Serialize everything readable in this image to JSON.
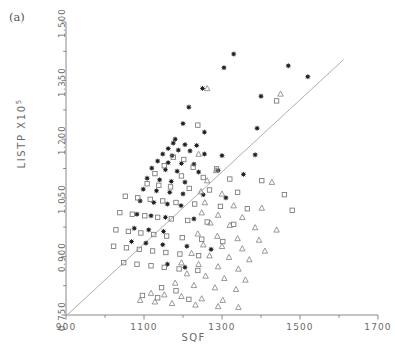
{
  "panel": {
    "label": "(a)"
  },
  "chart_data": {
    "type": "scatter",
    "title": "",
    "panel_label": "(a)",
    "xlabel": "SQF",
    "ylabel": "LISTP X10⁵",
    "ylabel_text": "LISTP X105",
    "xlim": [
      900,
      1700
    ],
    "ylim": [
      0.75,
      1.5
    ],
    "xticks": [
      900,
      1100,
      1300,
      1500,
      1700
    ],
    "xtick_labels": [
      "900",
      "1100",
      "1300",
      "1500",
      "1700"
    ],
    "x_minor_ticks": [
      1000,
      1200,
      1400,
      1600
    ],
    "yticks": [
      0.75,
      0.9,
      1.05,
      1.2,
      1.35,
      1.5
    ],
    "ytick_labels": [
      "0.750",
      "0.900",
      "1.050",
      "1.200",
      "1.350",
      "1.500"
    ],
    "y_minor_ticks": [
      0.825,
      0.975,
      1.125,
      1.275,
      1.425
    ],
    "grid": false,
    "legend_position": "none",
    "axis_style": "left-and-bottom-spines-only",
    "regression_line": {
      "label": "fitted regression line",
      "x_start": 905,
      "y_start": 0.752,
      "x_end": 1612,
      "y_end": 1.404
    },
    "series": [
      {
        "name": "asterisk-markers",
        "marker": "asterisk",
        "marker_label": "filled star/asterisk",
        "color": "#222222",
        "points": [
          [
            1330,
            1.418
          ],
          [
            1470,
            1.388
          ],
          [
            1305,
            1.383
          ],
          [
            1520,
            1.36
          ],
          [
            1250,
            1.33
          ],
          [
            1400,
            1.31
          ],
          [
            1215,
            1.282
          ],
          [
            1200,
            1.24
          ],
          [
            1390,
            1.228
          ],
          [
            1255,
            1.218
          ],
          [
            1180,
            1.2
          ],
          [
            1175,
            1.19
          ],
          [
            1205,
            1.186
          ],
          [
            1235,
            1.184
          ],
          [
            1162,
            1.176
          ],
          [
            1188,
            1.172
          ],
          [
            1218,
            1.17
          ],
          [
            1148,
            1.162
          ],
          [
            1172,
            1.158
          ],
          [
            1255,
            1.162
          ],
          [
            1300,
            1.158
          ],
          [
            1385,
            1.16
          ],
          [
            1135,
            1.144
          ],
          [
            1162,
            1.14
          ],
          [
            1196,
            1.138
          ],
          [
            1228,
            1.136
          ],
          [
            1120,
            1.126
          ],
          [
            1155,
            1.122
          ],
          [
            1185,
            1.118
          ],
          [
            1240,
            1.116
          ],
          [
            1290,
            1.12
          ],
          [
            1355,
            1.11
          ],
          [
            1108,
            1.1
          ],
          [
            1140,
            1.096
          ],
          [
            1170,
            1.092
          ],
          [
            1205,
            1.09
          ],
          [
            1098,
            1.072
          ],
          [
            1132,
            1.068
          ],
          [
            1166,
            1.064
          ],
          [
            1200,
            1.06
          ],
          [
            1252,
            1.058
          ],
          [
            1310,
            1.05
          ],
          [
            1090,
            1.042
          ],
          [
            1125,
            1.038
          ],
          [
            1160,
            1.034
          ],
          [
            1195,
            1.03
          ],
          [
            1082,
            1.008
          ],
          [
            1118,
            1.004
          ],
          [
            1155,
            1.0
          ],
          [
            1228,
            0.996
          ],
          [
            1075,
            0.972
          ],
          [
            1112,
            0.968
          ],
          [
            1150,
            0.964
          ],
          [
            1068,
            0.938
          ],
          [
            1105,
            0.934
          ],
          [
            1148,
            0.93
          ],
          [
            1210,
            0.926
          ],
          [
            1272,
            0.918
          ],
          [
            1160,
            0.88
          ],
          [
            1205,
            0.872
          ]
        ]
      },
      {
        "name": "open-square-markers",
        "marker": "open-square",
        "marker_label": "open square",
        "color": "#777777",
        "points": [
          [
            1238,
            1.236
          ],
          [
            1440,
            1.298
          ],
          [
            1175,
            1.154
          ],
          [
            1202,
            1.148
          ],
          [
            1152,
            1.132
          ],
          [
            1226,
            1.128
          ],
          [
            1286,
            1.124
          ],
          [
            1128,
            1.112
          ],
          [
            1196,
            1.106
          ],
          [
            1252,
            1.102
          ],
          [
            1320,
            1.098
          ],
          [
            1402,
            1.094
          ],
          [
            1108,
            1.086
          ],
          [
            1138,
            1.082
          ],
          [
            1168,
            1.078
          ],
          [
            1216,
            1.074
          ],
          [
            1268,
            1.07
          ],
          [
            1340,
            1.064
          ],
          [
            1460,
            1.058
          ],
          [
            1052,
            1.054
          ],
          [
            1084,
            1.05
          ],
          [
            1116,
            1.046
          ],
          [
            1148,
            1.042
          ],
          [
            1182,
            1.038
          ],
          [
            1230,
            1.034
          ],
          [
            1296,
            1.028
          ],
          [
            1365,
            1.022
          ],
          [
            1480,
            1.018
          ],
          [
            1038,
            1.012
          ],
          [
            1070,
            1.008
          ],
          [
            1102,
            1.004
          ],
          [
            1135,
            1.0
          ],
          [
            1170,
            0.996
          ],
          [
            1212,
            0.992
          ],
          [
            1262,
            0.988
          ],
          [
            1330,
            0.982
          ],
          [
            1028,
            0.968
          ],
          [
            1060,
            0.964
          ],
          [
            1092,
            0.96
          ],
          [
            1125,
            0.956
          ],
          [
            1158,
            0.952
          ],
          [
            1198,
            0.948
          ],
          [
            1248,
            0.944
          ],
          [
            1302,
            0.938
          ],
          [
            1022,
            0.926
          ],
          [
            1055,
            0.922
          ],
          [
            1088,
            0.918
          ],
          [
            1122,
            0.914
          ],
          [
            1156,
            0.91
          ],
          [
            1192,
            0.906
          ],
          [
            1240,
            0.902
          ],
          [
            1048,
            0.884
          ],
          [
            1082,
            0.88
          ],
          [
            1118,
            0.876
          ],
          [
            1152,
            0.872
          ],
          [
            1190,
            0.868
          ],
          [
            1238,
            0.864
          ],
          [
            1145,
            0.82
          ],
          [
            1182,
            0.812
          ],
          [
            1096,
            0.8
          ],
          [
            1135,
            0.794
          ],
          [
            1215,
            0.79
          ]
        ]
      },
      {
        "name": "open-triangle-markers",
        "marker": "open-triangle",
        "marker_label": "open triangle",
        "color": "#888888",
        "points": [
          [
            1262,
            1.33
          ],
          [
            1450,
            1.316
          ],
          [
            1240,
            1.162
          ],
          [
            1285,
            1.12
          ],
          [
            1262,
            1.094
          ],
          [
            1428,
            1.09
          ],
          [
            1246,
            1.066
          ],
          [
            1300,
            1.06
          ],
          [
            1256,
            1.038
          ],
          [
            1330,
            1.03
          ],
          [
            1402,
            1.024
          ],
          [
            1248,
            1.012
          ],
          [
            1290,
            1.006
          ],
          [
            1352,
            1.0
          ],
          [
            1270,
            0.986
          ],
          [
            1320,
            0.98
          ],
          [
            1385,
            0.974
          ],
          [
            1440,
            0.968
          ],
          [
            1238,
            0.958
          ],
          [
            1288,
            0.952
          ],
          [
            1340,
            0.946
          ],
          [
            1395,
            0.942
          ],
          [
            1252,
            0.93
          ],
          [
            1300,
            0.926
          ],
          [
            1352,
            0.92
          ],
          [
            1410,
            0.914
          ],
          [
            1222,
            0.908
          ],
          [
            1268,
            0.902
          ],
          [
            1318,
            0.898
          ],
          [
            1370,
            0.892
          ],
          [
            1196,
            0.884
          ],
          [
            1240,
            0.88
          ],
          [
            1290,
            0.874
          ],
          [
            1342,
            0.868
          ],
          [
            1210,
            0.856
          ],
          [
            1258,
            0.85
          ],
          [
            1306,
            0.844
          ],
          [
            1360,
            0.84
          ],
          [
            1180,
            0.832
          ],
          [
            1228,
            0.826
          ],
          [
            1282,
            0.82
          ],
          [
            1336,
            0.816
          ],
          [
            1118,
            0.806
          ],
          [
            1152,
            0.802
          ],
          [
            1196,
            0.798
          ],
          [
            1090,
            0.788
          ],
          [
            1128,
            0.784
          ],
          [
            1172,
            0.78
          ],
          [
            1232,
            0.776
          ],
          [
            1290,
            0.772
          ],
          [
            1342,
            0.77
          ],
          [
            1248,
            0.792
          ],
          [
            1302,
            0.788
          ]
        ]
      }
    ]
  }
}
